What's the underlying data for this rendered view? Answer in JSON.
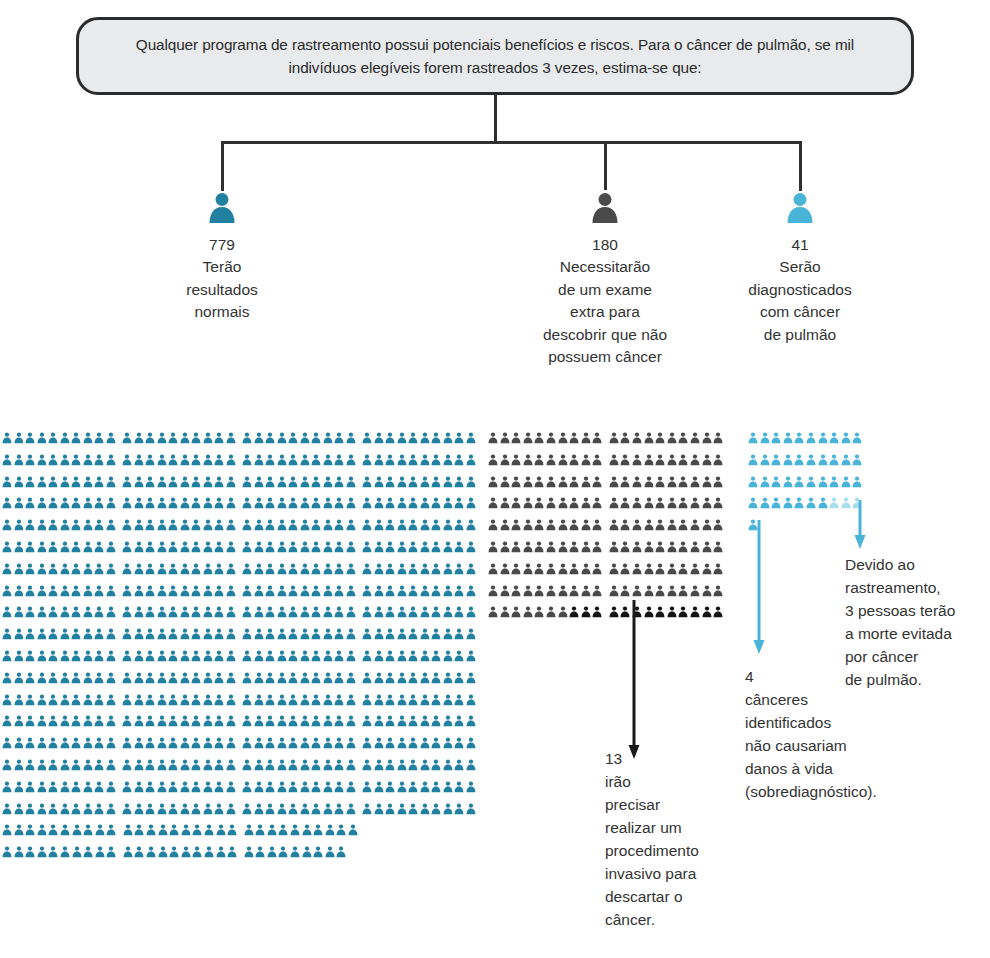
{
  "header": {
    "text": "Qualquer programa de rastreamento possui potenciais benefícios e riscos. Para o câncer de pulmão, se mil indivíduos elegíveis forem rastreados 3 vezes, estima-se que:"
  },
  "colors": {
    "teal": "#2281a0",
    "gray": "#4a4a4a",
    "black": "#141414",
    "light_blue": "#4ab4d8",
    "faded_blue": "#a9dcee",
    "line": "#2f2f2f",
    "box_fill": "#e8eaec",
    "box_border": "#2b2b2b",
    "text": "#333333"
  },
  "columns": [
    {
      "icon": "person-icon",
      "icon_color": "#2281a0",
      "count": "779",
      "label": "Terão\nresultados\nnormais"
    },
    {
      "icon": "person-icon",
      "icon_color": "#4a4a4a",
      "count": "180",
      "label": "Necessitarão\nde um exame\nextra para\ndescobrir que não\npossuem câncer"
    },
    {
      "icon": "person-icon",
      "icon_color": "#4ab4d8",
      "count": "41",
      "label": "Serão\ndiagnosticados\ncom câncer\nde pulmão"
    }
  ],
  "annotations": [
    {
      "id": "invasive-procedure-note",
      "text": "13\nirão\nprecisar\nrealizar um\nprocedimento\ninvasivo para\ndescartar o\ncâncer."
    },
    {
      "id": "overdiagnosis-note",
      "text": "4\ncânceres\nidentificados\nnão causariam\ndanos à vida\n(sobrediagnóstico)."
    },
    {
      "id": "deaths-averted-note",
      "text": "Devido ao\nrastreamento,\n3 pessoas terão\na morte evitada\npor câncer\nde pulmão."
    }
  ],
  "chart_data": {
    "type": "pictogram",
    "total": 1000,
    "unit": "1 ícone = 1 pessoa",
    "groups": [
      {
        "name": "Terão resultados normais",
        "value": 779,
        "color": "#2281a0",
        "columns": 40,
        "group_size": 10,
        "rows": [
          40,
          40,
          40,
          40,
          40,
          40,
          40,
          40,
          40,
          40,
          40,
          40,
          40,
          40,
          40,
          40,
          40,
          40,
          30,
          29
        ]
      },
      {
        "name": "Necessitarão de um exame extra para descobrir que não possuem câncer",
        "value": 180,
        "color": "#4a4a4a",
        "columns": 20,
        "group_size": 10,
        "rows": [
          20,
          20,
          20,
          20,
          20,
          20,
          20,
          20,
          20
        ],
        "highlight": {
          "name": "Irão precisar realizar um procedimento invasivo para descartar o câncer",
          "value": 13,
          "color": "#141414"
        }
      },
      {
        "name": "Serão diagnosticados com câncer de pulmão",
        "value": 41,
        "color": "#4ab4d8",
        "columns": 10,
        "group_size": 10,
        "rows": [
          10,
          10,
          10,
          10,
          1
        ],
        "highlight": {
          "name": "Cânceres identificados que não causariam danos à vida (sobrediagnóstico)",
          "value": 4,
          "color": "#a9dcee"
        },
        "secondary_highlight": {
          "name": "Pessoas que terão a morte evitada por câncer de pulmão",
          "value": 3,
          "color": "#4ab4d8"
        }
      }
    ]
  }
}
